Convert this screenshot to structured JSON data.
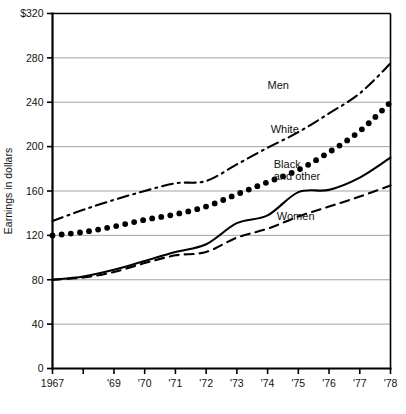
{
  "chart_data": {
    "type": "line",
    "title": "",
    "xlabel": "",
    "ylabel": "Earnings in dollars",
    "ylim": [
      0,
      320
    ],
    "xlim": [
      1967,
      1978
    ],
    "grid": "horizontal",
    "legend_position": "inline-annotations",
    "y_ticks": [
      0,
      40,
      80,
      120,
      160,
      200,
      240,
      280,
      320
    ],
    "y_tick_labels": [
      "0",
      "40",
      "80",
      "120",
      "160",
      "200",
      "240",
      "280",
      "$320"
    ],
    "x_ticks": [
      1967,
      1968,
      1969,
      1970,
      1971,
      1972,
      1973,
      1974,
      1975,
      1976,
      1977,
      1978
    ],
    "x_tick_labels": [
      "1967",
      "",
      "'69",
      "'70",
      "'71",
      "'72",
      "'73",
      "'74",
      "'75",
      "'76",
      "'77",
      "'78"
    ],
    "x": [
      1967,
      1968,
      1969,
      1970,
      1971,
      1972,
      1973,
      1974,
      1975,
      1976,
      1977,
      1978
    ],
    "series": [
      {
        "name": "Men",
        "style": "dash-dot",
        "label": "Men",
        "label_x": 1974.0,
        "label_y": 252,
        "values": [
          133,
          143,
          152,
          160,
          167,
          169,
          184,
          199,
          213,
          230,
          248,
          275
        ]
      },
      {
        "name": "White",
        "style": "dotted",
        "label": "White",
        "label_x": 1974.1,
        "label_y": 212,
        "values": [
          120,
          123,
          128,
          134,
          139,
          146,
          157,
          168,
          179,
          195,
          214,
          240
        ]
      },
      {
        "name": "Black and other",
        "style": "solid",
        "label": "Black and other",
        "label_x": 1974.2,
        "label_y": 181,
        "values": [
          80,
          83,
          89,
          97,
          105,
          112,
          131,
          138,
          159,
          161,
          172,
          190
        ]
      },
      {
        "name": "Women",
        "style": "dashed",
        "label": "Women",
        "label_x": 1974.3,
        "label_y": 134,
        "values": [
          80,
          82,
          87,
          95,
          102,
          105,
          118,
          126,
          137,
          146,
          155,
          165
        ]
      }
    ]
  }
}
